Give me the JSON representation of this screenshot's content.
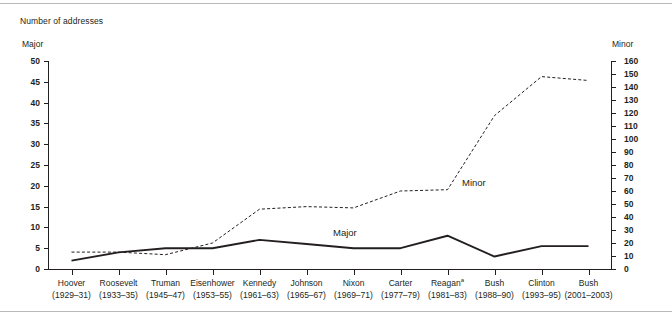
{
  "figure": {
    "title": "Number of addresses",
    "left_axis_caption": "Major",
    "right_axis_caption": "Minor"
  },
  "annotations": {
    "major_label": "Major",
    "minor_label": "Minor"
  },
  "chart_data": {
    "type": "line",
    "title": "Number of addresses",
    "xlabel": "",
    "ylabel": "Major",
    "y2label": "Minor",
    "ylim": [
      0,
      50
    ],
    "y2lim": [
      0,
      160
    ],
    "yticks": [
      0,
      5,
      10,
      15,
      20,
      25,
      30,
      35,
      40,
      45,
      50
    ],
    "y2ticks": [
      0,
      10,
      20,
      30,
      40,
      50,
      60,
      70,
      80,
      90,
      100,
      110,
      120,
      130,
      140,
      150,
      160
    ],
    "grid": false,
    "legend": "inline-annotation",
    "categories": [
      {
        "name": "Hoover",
        "years": "(1929–31)"
      },
      {
        "name": "Roosevelt",
        "years": "(1933–35)"
      },
      {
        "name": "Truman",
        "years": "(1945–47)"
      },
      {
        "name": "Eisenhower",
        "years": "(1953–55)"
      },
      {
        "name": "Kennedy",
        "years": "(1961–63)"
      },
      {
        "name": "Johnson",
        "years": "(1965–67)"
      },
      {
        "name": "Nixon",
        "years": "(1969–71)"
      },
      {
        "name": "Carter",
        "years": "(1977–79)"
      },
      {
        "name": "Reagan",
        "years": "(1981–83)",
        "footnote": "a"
      },
      {
        "name": "Bush",
        "years": "(1988–90)"
      },
      {
        "name": "Clinton",
        "years": "(1993–95)"
      },
      {
        "name": "Bush",
        "years": "(2001–2003)"
      }
    ],
    "series": [
      {
        "name": "Major",
        "axis": "left",
        "style": "solid",
        "color": "#231f20",
        "values": [
          2,
          4,
          5,
          5,
          7,
          6,
          5,
          5,
          8,
          3,
          5.5,
          5.5
        ]
      },
      {
        "name": "Minor",
        "axis": "right",
        "style": "dashed",
        "color": "#231f20",
        "values": [
          13,
          13,
          11,
          20,
          46,
          48,
          47,
          60,
          61,
          118,
          148,
          145
        ]
      }
    ]
  }
}
